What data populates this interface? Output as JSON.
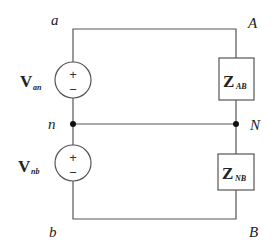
{
  "diagram": {
    "type": "circuit",
    "nodes": {
      "a": "a",
      "b": "b",
      "n": "n",
      "A": "A",
      "B": "B",
      "N": "N"
    },
    "sources": [
      {
        "id": "Van",
        "symbol": "V",
        "subscript": "an",
        "plus": "+",
        "minus": "−"
      },
      {
        "id": "Vnb",
        "symbol": "V",
        "subscript": "nb",
        "plus": "+",
        "minus": "−"
      }
    ],
    "loads": [
      {
        "id": "ZAB",
        "symbol": "Z",
        "subscript": "AB"
      },
      {
        "id": "ZNB",
        "symbol": "Z",
        "subscript": "NB"
      }
    ],
    "colors": {
      "wire": "#555555",
      "text": "#222222"
    }
  }
}
